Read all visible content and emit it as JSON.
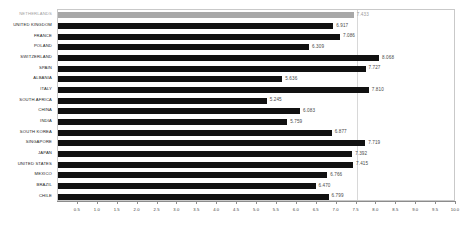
{
  "chart_data": {
    "type": "bar",
    "orientation": "horizontal",
    "title": "",
    "subtitle": "",
    "xlabel": "",
    "ylabel": "",
    "xlim": [
      0,
      10
    ],
    "grid": false,
    "legend": null,
    "reference_line": 7.5,
    "highlight_category": "NETHERLANDS",
    "xticks": [
      "0.5",
      "1.0",
      "1.5",
      "2.0",
      "2.5",
      "3.0",
      "3.5",
      "4.0",
      "4.5",
      "5.0",
      "5.5",
      "6.0",
      "6.5",
      "7.0",
      "7.5",
      "8.0",
      "8.5",
      "9.0",
      "9.5",
      "10.0"
    ],
    "xtick_values": [
      0.5,
      1.0,
      1.5,
      2.0,
      2.5,
      3.0,
      3.5,
      4.0,
      4.5,
      5.0,
      5.5,
      6.0,
      6.5,
      7.0,
      7.5,
      8.0,
      8.5,
      9.0,
      9.5,
      10.0
    ],
    "categories": [
      "NETHERLANDS",
      "UNITED KINGDOM",
      "FRANCE",
      "POLAND",
      "SWITZERLAND",
      "SPAIN",
      "ALBANIA",
      "ITALY",
      "SOUTH AFRICA",
      "CHINA",
      "INDIA",
      "SOUTH KOREA",
      "SINGAPORE",
      "JAPAN",
      "UNITED STATES",
      "MEXICO",
      "BRAZIL",
      "CHILE"
    ],
    "values": [
      7.433,
      6.917,
      7.086,
      6.309,
      8.068,
      7.727,
      5.636,
      7.81,
      5.245,
      6.083,
      5.759,
      6.877,
      7.719,
      7.392,
      7.415,
      6.766,
      6.47,
      6.799
    ],
    "value_labels": [
      "7.433",
      "6.917",
      "7.086",
      "6.309",
      "8.068",
      "7.727",
      "5.636",
      "7.810",
      "5.245",
      "6.083",
      "5.759",
      "6.877",
      "7.719",
      "7.392",
      "7.415",
      "6.766",
      "6.470",
      "6.799"
    ],
    "colors": {
      "bar": "#111111",
      "bar_highlight": "#a8a8a8",
      "label": "#1a1a1a",
      "label_highlight": "#a0a0a0",
      "value_label": "#4a4a4a",
      "axis": "#8c8c8c",
      "plot_border": "#c9c9c9",
      "reference_line": "#d8d8d8"
    }
  }
}
